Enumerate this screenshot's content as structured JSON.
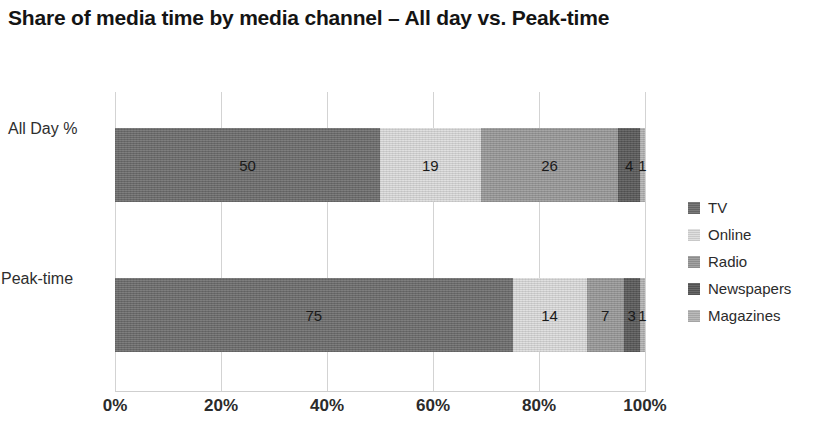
{
  "chart_data": {
    "type": "bar",
    "subtype": "stacked-horizontal-100pct",
    "title": "Share of media time by media channel – All day vs. Peak-time",
    "xlabel": "",
    "ylabel": "",
    "xlim": [
      0,
      100
    ],
    "xticks": [
      "0%",
      "20%",
      "40%",
      "60%",
      "80%",
      "100%"
    ],
    "xtick_values": [
      0,
      20,
      40,
      60,
      80,
      100
    ],
    "grid": true,
    "legend_position": "right",
    "categories": [
      "All Day %",
      "Peak-time"
    ],
    "series": [
      {
        "name": "TV",
        "color": "#6e6e6e",
        "values": [
          50,
          75
        ]
      },
      {
        "name": "Online",
        "color": "#dcdcdc",
        "values": [
          19,
          14
        ]
      },
      {
        "name": "Radio",
        "color": "#9a9a9a",
        "values": [
          26,
          7
        ]
      },
      {
        "name": "Newspapers",
        "color": "#5a5a5a",
        "values": [
          4,
          3
        ]
      },
      {
        "name": "Magazines",
        "color": "#b4b4b4",
        "values": [
          1,
          1
        ]
      }
    ],
    "bars": [
      {
        "category": "All Day %",
        "segments": [
          {
            "name": "TV",
            "value": 50,
            "label": "50",
            "color": "#6e6e6e"
          },
          {
            "name": "Online",
            "value": 19,
            "label": "19",
            "color": "#dcdcdc"
          },
          {
            "name": "Radio",
            "value": 26,
            "label": "26",
            "color": "#9a9a9a"
          },
          {
            "name": "Newspapers",
            "value": 4,
            "label": "4",
            "color": "#5a5a5a"
          },
          {
            "name": "Magazines",
            "value": 1,
            "label": "1",
            "color": "#b4b4b4"
          }
        ]
      },
      {
        "category": "Peak-time",
        "segments": [
          {
            "name": "TV",
            "value": 75,
            "label": "75",
            "color": "#6e6e6e"
          },
          {
            "name": "Online",
            "value": 14,
            "label": "14",
            "color": "#dcdcdc"
          },
          {
            "name": "Radio",
            "value": 7,
            "label": "7",
            "color": "#9a9a9a"
          },
          {
            "name": "Newspapers",
            "value": 3,
            "label": "3",
            "color": "#5a5a5a"
          },
          {
            "name": "Magazines",
            "value": 1,
            "label": "1",
            "color": "#b4b4b4"
          }
        ]
      }
    ]
  }
}
